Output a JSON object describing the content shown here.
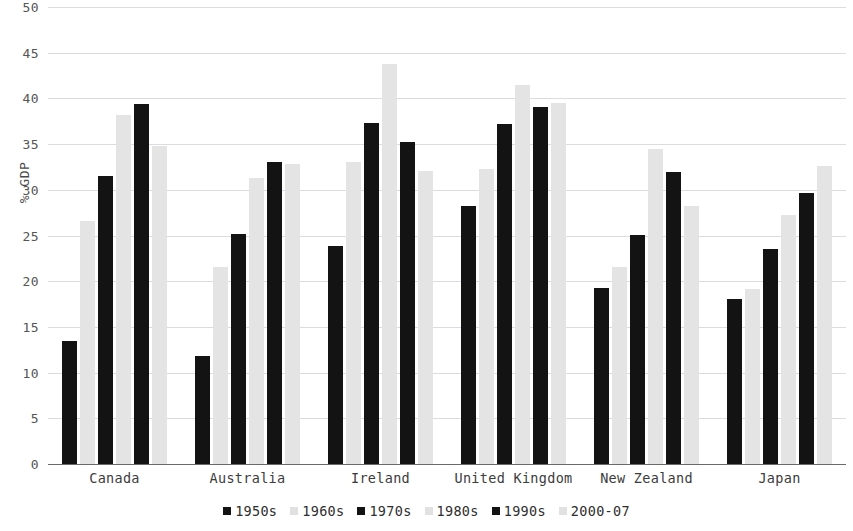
{
  "chart_data": {
    "type": "bar",
    "title": "",
    "subtitle": "",
    "xlabel": "",
    "ylabel": "% GDP",
    "ylim": [
      0,
      50
    ],
    "yticks": [
      0,
      5,
      10,
      15,
      20,
      25,
      30,
      35,
      40,
      45,
      50
    ],
    "grid": true,
    "legend_position": "bottom",
    "categories": [
      "Canada",
      "Australia",
      "Ireland",
      "United Kingdom",
      "New Zealand",
      "Japan"
    ],
    "series": [
      {
        "name": "1950s",
        "color": "#131313",
        "values": [
          13.5,
          11.8,
          23.8,
          28.2,
          19.3,
          18.0
        ]
      },
      {
        "name": "1960s",
        "color": "#e4e4e4",
        "values": [
          26.6,
          21.6,
          33.0,
          32.3,
          21.6,
          19.1
        ]
      },
      {
        "name": "1970s",
        "color": "#131313",
        "values": [
          31.5,
          25.2,
          37.3,
          37.2,
          25.1,
          23.5
        ]
      },
      {
        "name": "1980s",
        "color": "#e4e4e4",
        "values": [
          38.2,
          31.3,
          43.8,
          41.5,
          34.5,
          27.2
        ]
      },
      {
        "name": "1990s",
        "color": "#131313",
        "values": [
          39.4,
          33.0,
          35.2,
          39.1,
          31.9,
          29.6
        ]
      },
      {
        "name": "2000-07",
        "color": "#e4e4e4",
        "values": [
          34.8,
          32.8,
          32.1,
          39.5,
          28.2,
          32.6
        ]
      }
    ]
  },
  "axis": {
    "y_title": "% GDP"
  },
  "colors": {
    "dark_series": "#131313",
    "light_series": "#e4e4e4",
    "gridline": "#d9dde2",
    "axis": "#6a6a6a",
    "tick_text": "#555555",
    "category_text": "#3c3c3c"
  }
}
